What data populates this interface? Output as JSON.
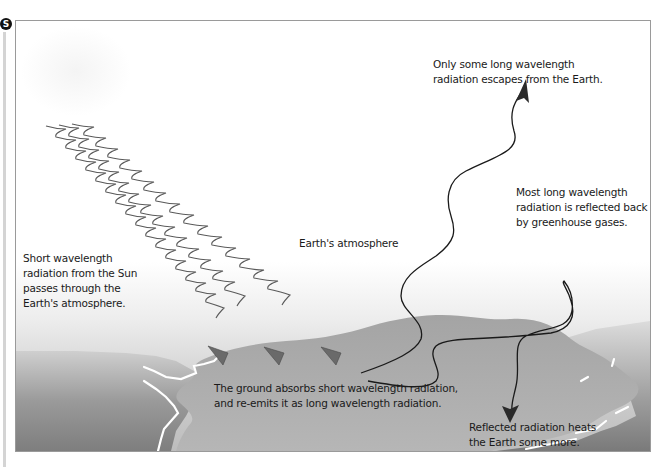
{
  "badge": {
    "letter": "S"
  },
  "diagram": {
    "labels": {
      "short_wave": {
        "lines": [
          "Short wavelength",
          "radiation from the Sun",
          "passes through the",
          "Earth's atmosphere."
        ]
      },
      "atmosphere": {
        "lines": [
          "Earth's atmosphere"
        ]
      },
      "escapes": {
        "lines": [
          "Only some long wavelength",
          "radiation escapes from the Earth."
        ]
      },
      "reflected_back": {
        "lines": [
          "Most long wavelength",
          "radiation is reflected back",
          "by greenhouse gases."
        ]
      },
      "ground_absorbs": {
        "lines": [
          "The ground absorbs short wavelength radiation,",
          "and re-emits it as long wavelength radiation."
        ]
      },
      "reheats": {
        "lines": [
          "Reflected radiation heats",
          "the Earth some more."
        ]
      }
    },
    "colors": {
      "sky_top": "#ffffff",
      "sky_haze": "#c8c8c8",
      "land": "#a9a9a9",
      "sea": "#8c8c8c",
      "coast": "#ffffff",
      "short_wave_stroke": "#555555",
      "long_wave_stroke": "#1a1a1a",
      "short_arrowhead": "#6a6a6a",
      "long_arrowhead": "#2a2a2a",
      "frame": "#9a9a9a"
    },
    "arrows": {
      "short_wave_count": 3,
      "long_wave_escaping": 1,
      "long_wave_reflected": 1
    }
  }
}
